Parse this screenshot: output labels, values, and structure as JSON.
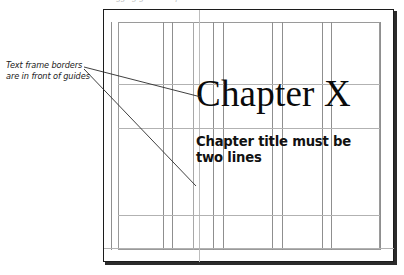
{
  "figure": {
    "type": "page-layout-diagram",
    "top_cut_text": "dragging guides to position elements",
    "page": {
      "frame_color": "#1c1c1c",
      "margin_box_color": "#9a9a9a",
      "guide_color": "#a8a8a8"
    },
    "annotation": {
      "line1": "Text frame borders",
      "line2": "are in front of guides"
    },
    "title": "Chapter X",
    "subtitle": "Chapter title must be two lines",
    "subtitle_lines": [
      "Chapter title must be",
      "two lines"
    ],
    "guides": {
      "vertical_x": [
        111,
        163,
        172,
        193,
        213,
        223,
        272,
        282,
        322,
        331,
        380
      ],
      "vertical_full_x": [
        199
      ],
      "horizontal_y": [
        22,
        84,
        128,
        215,
        250
      ],
      "horizontal_wide_y": [
        248
      ]
    }
  }
}
